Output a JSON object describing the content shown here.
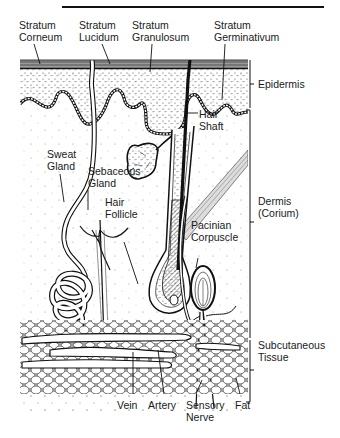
{
  "figure": {
    "top_labels": [
      {
        "id": "stratum-corneum",
        "lines": [
          "Stratum",
          "Corneum"
        ]
      },
      {
        "id": "stratum-lucidum",
        "lines": [
          "Stratum",
          "Lucidum"
        ]
      },
      {
        "id": "stratum-granulosum",
        "lines": [
          "Stratum",
          "Granulosum"
        ]
      },
      {
        "id": "stratum-germinativum",
        "lines": [
          "Stratum",
          "Germinativum"
        ]
      }
    ],
    "layer_labels": [
      {
        "id": "epidermis",
        "lines": [
          "Epidermis"
        ]
      },
      {
        "id": "dermis",
        "lines": [
          "Dermis",
          "(Corium)"
        ]
      },
      {
        "id": "subcutaneous",
        "lines": [
          "Subcutaneous",
          "Tissue"
        ]
      }
    ],
    "inner_labels": [
      {
        "id": "hair-shaft",
        "lines": [
          "Hair",
          "Shaft"
        ]
      },
      {
        "id": "sweat-gland",
        "lines": [
          "Sweat",
          "Gland"
        ]
      },
      {
        "id": "sebaceous-gland",
        "lines": [
          "Sebaceous",
          "Gland"
        ]
      },
      {
        "id": "hair-follicle",
        "lines": [
          "Hair",
          "Follicle"
        ]
      },
      {
        "id": "pacinian-corpuscle",
        "lines": [
          "Pacinian",
          "Corpuscle"
        ]
      }
    ],
    "bottom_labels": [
      {
        "id": "vein",
        "lines": [
          "Vein"
        ]
      },
      {
        "id": "artery",
        "lines": [
          "Artery"
        ]
      },
      {
        "id": "sensory-nerve",
        "lines": [
          "Sensory",
          "Nerve"
        ]
      },
      {
        "id": "fat",
        "lines": [
          "Fat"
        ]
      }
    ],
    "colors": {
      "ink": "#1a1a1a",
      "background": "#ffffff",
      "stipple": "#555555"
    }
  }
}
